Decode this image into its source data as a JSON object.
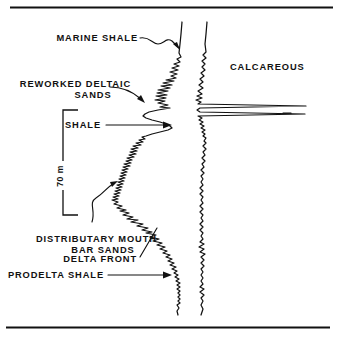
{
  "figure": {
    "background_color": "#ffffff",
    "ink_color": "#111111",
    "width": 341,
    "height": 339
  },
  "rules": {
    "top_rule_label": "top-border-rule",
    "bottom_rule_label": "bottom-border-rule"
  },
  "scale": {
    "value": "70",
    "unit": "m",
    "combined": "70 m",
    "orientation": "vertical-rotated"
  },
  "annotations": [
    {
      "id": "marine-shale",
      "lines": [
        "MARINE SHALE"
      ],
      "leader": "curved-arrow",
      "points_to": "upper log segment"
    },
    {
      "id": "reworked-deltaic-sands",
      "lines": [
        "REWORKED DELTAIC",
        "SANDS"
      ],
      "leader": "curved-arrow",
      "points_to": "serrated upper sand interval"
    },
    {
      "id": "shale",
      "lines": [
        "SHALE"
      ],
      "leader": "straight-arrow",
      "points_to": "shale bulge"
    },
    {
      "id": "distributary-mouth-bar-sands",
      "lines": [
        "DISTRIBUTARY MOUTH",
        "BAR SANDS"
      ],
      "leader": "curved-arrow",
      "points_to": "funnel shaped sand body"
    },
    {
      "id": "delta-front",
      "lines": [
        "DELTA FRONT"
      ],
      "leader": "diagonal-line",
      "points_to": "lower serrated interval"
    },
    {
      "id": "prodelta-shale",
      "lines": [
        "PRODELTA SHALE"
      ],
      "leader": "straight-arrow",
      "points_to": "basal shale baseline"
    },
    {
      "id": "calcareous",
      "lines": [
        "CALCAREOUS"
      ],
      "leader": "none",
      "points_to": "right curve high spikes"
    }
  ],
  "chart_data": {
    "type": "line",
    "xlabel": "",
    "ylabel": "",
    "orientation": "vertical-depth",
    "grid": false,
    "legend": "none",
    "series": [
      {
        "name": "left-log-curve",
        "description": "Gamma-ray / SP style curve showing deltaic facies succession",
        "points": "M182,22 L181,34 L180,44 L179,53 L181,57 L177,59 L180,62 L174,64 L179,66 L172,68 L178,70 L170,72 L177,74 L171,76 L176,78 L166,80 L174,81 L163,83 L172,85 L161,86 L170,88 L158,90 L168,91 L157,93 L167,95 L156,96 L166,98 L155,100 L165,101 L158,103 L168,105 L160,107 L170,108 L158,110 L149,112 L145,114 L143,116 L146,118 L152,120 L160,122 L166,124 L170,126 L172,128 L168,130 L160,132 L152,134 L146,136 L142,137 L145,139 L139,140 L143,142 L136,143 L141,145 L133,146 L138,148 L131,149 L137,151 L130,152 L136,154 L129,155 L134,157 L127,158 L132,160 L126,161 L131,163 L124,164 L130,166 L123,167 L128,169 L122,170 L127,172 L121,173 L126,175 L120,176 L125,178 L119,179 L124,181 L118,182 L123,184 L117,185 L122,187 L116,188 L121,190 L115,191 L120,193 L114,194 L119,196 L113,197 L118,199 L112,200 L118,202 L114,204 L122,206 L117,208 L126,210 L120,211 L129,213 L123,215 L133,217 L127,219 L138,220 L131,222 L143,224 L137,226 L148,228 L142,230 L152,232 L146,233 L156,235 L150,237 L159,239 L153,241 L162,243 L157,245 L165,247 L160,249 L167,251 L163,253 L170,255 L166,257 L172,259 L168,261 L174,263 L170,265 L176,267 L172,269 L177,271 L174,273 L178,275 L175,277 L179,279 L176,281 L180,283 L177,285 L180,287 L177,289 L180,291 L178,293 L180,295 L178,297 L180,299 L178,301 L180,303 L177,305 L179,308 L177,311 L178,315"
      },
      {
        "name": "right-log-curve",
        "description": "Resistivity style curve with calcareous high spikes",
        "points": "M207,22 L206,34 L205,44 L206,52 L203,55 L206,58 L202,61 L205,64 L202,67 L205,70 L201,73 L204,76 L200,79 L203,82 L199,85 L203,88 L198,91 L202,94 L197,96 L202,98 L196,100 L201,102 L198,104 L306,106 L200,108 L197,110 L200,112 L305,114 L198,116 L202,118 L199,120 L203,122 L200,124 L204,126 L201,128 L205,130 L202,132 L205,134 L203,136 L206,138 L204,141 L206,143 L203,146 L206,149 L203,152 L205,155 L202,158 L205,161 L202,164 L204,167 L201,170 L204,173 L201,176 L203,179 L201,182 L203,185 L200,188 L203,191 L200,194 L203,197 L201,200 L203,203 L200,206 L203,209 L200,212 L203,215 L201,218 L203,221 L200,224 L203,227 L200,230 L203,233 L201,236 L203,239 L200,242 L204,244 L199,247 L204,249 L200,252 L205,254 L201,257 L204,260 L201,263 L204,266 L201,269 L203,272 L201,275 L203,278 L201,281 L203,284 L200,287 L204,289 L200,292 L204,295 L201,298 L203,301 L201,305 L203,309 L201,315"
      }
    ],
    "spikes": [
      {
        "name": "calcareous-spike-upper",
        "depth_y": 106,
        "extends_to_x": 306
      },
      {
        "name": "calcareous-spike-lower",
        "depth_y": 114,
        "extends_to_x": 305
      }
    ]
  }
}
